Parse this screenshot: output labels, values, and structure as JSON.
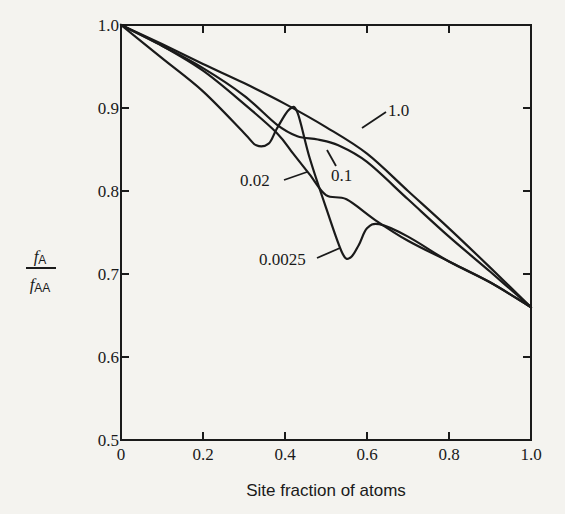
{
  "chart_data": {
    "type": "line",
    "title": "",
    "xlabel": "Site fraction of atoms",
    "ylabel": "fA / fAA",
    "ylabel_parts": {
      "numerator": "f",
      "numerator_sub": "A",
      "denominator": "f",
      "denominator_sub": "AA"
    },
    "xlim": [
      0,
      1.0
    ],
    "ylim": [
      0.5,
      1.0
    ],
    "x_ticks": [
      "0",
      "0.2",
      "0.4",
      "0.6",
      "0.8",
      "1.0"
    ],
    "y_ticks": [
      "0.5",
      "0.6",
      "0.7",
      "0.8",
      "0.9",
      "1.0"
    ],
    "grid": false,
    "legend": "inline annotations",
    "series": [
      {
        "name": "1.0",
        "label": "1.0",
        "points": [
          [
            0,
            1.0
          ],
          [
            0.1,
            0.977
          ],
          [
            0.2,
            0.953
          ],
          [
            0.3,
            0.93
          ],
          [
            0.4,
            0.905
          ],
          [
            0.5,
            0.877
          ],
          [
            0.6,
            0.845
          ],
          [
            0.7,
            0.8
          ],
          [
            0.8,
            0.755
          ],
          [
            0.9,
            0.708
          ],
          [
            1.0,
            0.66
          ]
        ]
      },
      {
        "name": "0.1",
        "label": "0.1",
        "points": [
          [
            0,
            1.0
          ],
          [
            0.1,
            0.975
          ],
          [
            0.2,
            0.948
          ],
          [
            0.3,
            0.915
          ],
          [
            0.38,
            0.88
          ],
          [
            0.43,
            0.866
          ],
          [
            0.48,
            0.862
          ],
          [
            0.53,
            0.855
          ],
          [
            0.6,
            0.835
          ],
          [
            0.7,
            0.79
          ],
          [
            0.8,
            0.745
          ],
          [
            0.9,
            0.703
          ],
          [
            1.0,
            0.66
          ]
        ]
      },
      {
        "name": "0.02",
        "label": "0.02",
        "points": [
          [
            0,
            1.0
          ],
          [
            0.1,
            0.975
          ],
          [
            0.2,
            0.945
          ],
          [
            0.3,
            0.905
          ],
          [
            0.38,
            0.87
          ],
          [
            0.42,
            0.845
          ],
          [
            0.46,
            0.82
          ],
          [
            0.5,
            0.795
          ],
          [
            0.55,
            0.79
          ],
          [
            0.62,
            0.765
          ],
          [
            0.7,
            0.74
          ],
          [
            0.8,
            0.715
          ],
          [
            0.9,
            0.69
          ],
          [
            1.0,
            0.66
          ]
        ]
      },
      {
        "name": "0.0025",
        "label": "0.0025",
        "points": [
          [
            0,
            1.0
          ],
          [
            0.1,
            0.96
          ],
          [
            0.2,
            0.92
          ],
          [
            0.3,
            0.87
          ],
          [
            0.33,
            0.855
          ],
          [
            0.36,
            0.857
          ],
          [
            0.38,
            0.875
          ],
          [
            0.41,
            0.898
          ],
          [
            0.43,
            0.895
          ],
          [
            0.46,
            0.84
          ],
          [
            0.5,
            0.78
          ],
          [
            0.54,
            0.725
          ],
          [
            0.56,
            0.72
          ],
          [
            0.58,
            0.735
          ],
          [
            0.6,
            0.755
          ],
          [
            0.63,
            0.76
          ],
          [
            0.7,
            0.745
          ],
          [
            0.8,
            0.715
          ],
          [
            0.9,
            0.69
          ],
          [
            1.0,
            0.66
          ]
        ]
      }
    ],
    "annotations": [
      {
        "text": "1.0",
        "x": 0.6,
        "y": 0.905
      },
      {
        "text": "0.1",
        "x": 0.52,
        "y": 0.82
      },
      {
        "text": "0.02",
        "x": 0.27,
        "y": 0.81
      },
      {
        "text": "0.0025",
        "x": 0.35,
        "y": 0.715
      }
    ]
  }
}
